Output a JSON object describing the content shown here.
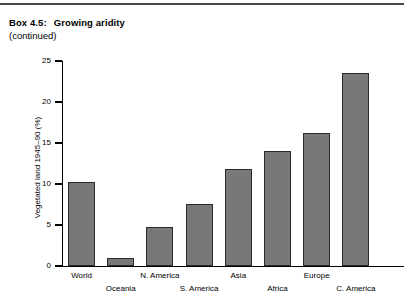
{
  "header": {
    "box_number": "Box 4.5:",
    "title": "Growing aridity",
    "subtitle": "(continued)"
  },
  "chart_data": {
    "type": "bar",
    "title": "Growing aridity",
    "xlabel": "",
    "ylabel": "Vegetated land 1945–90 (%)",
    "ylim": [
      0,
      25
    ],
    "yticks": [
      0,
      5,
      10,
      15,
      20,
      25
    ],
    "ytick_labels": [
      "0",
      "5",
      "10",
      "15",
      "20",
      "25"
    ],
    "grid": false,
    "legend": false,
    "categories": [
      "World",
      "Oceania",
      "N. America",
      "S. America",
      "Asia",
      "Africa",
      "Europe",
      "C. America"
    ],
    "values": [
      10.3,
      1.0,
      4.7,
      7.6,
      11.8,
      14.0,
      16.2,
      23.5
    ],
    "bar_color": "#787878",
    "bar_edge_color": "#2b2b2b",
    "label_rows": [
      "top",
      "bottom",
      "top",
      "bottom",
      "top",
      "bottom",
      "top",
      "bottom"
    ]
  }
}
